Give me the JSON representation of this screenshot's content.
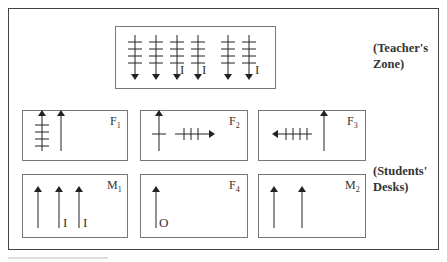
{
  "zones": {
    "teacher": {
      "line1": "(Teacher's",
      "line2": "Zone)"
    },
    "students": {
      "line1": "(Students'",
      "line2": "Desks)"
    }
  },
  "desks": [
    {
      "id": "F1",
      "letter": "F",
      "sub": "1"
    },
    {
      "id": "F2",
      "letter": "F",
      "sub": "2"
    },
    {
      "id": "F3",
      "letter": "F",
      "sub": "3"
    },
    {
      "id": "M1",
      "letter": "M",
      "sub": "1"
    },
    {
      "id": "F4",
      "letter": "F",
      "sub": "4"
    },
    {
      "id": "M2",
      "letter": "M",
      "sub": "2"
    }
  ],
  "marks": {
    "teacher_I_labels": [
      "I",
      "I",
      "I"
    ],
    "m1_I_labels": [
      "I",
      "I"
    ],
    "f4_O_label": "O"
  },
  "colors": {
    "line": "#222222",
    "box_border": "#777777",
    "frame": "#444444"
  }
}
